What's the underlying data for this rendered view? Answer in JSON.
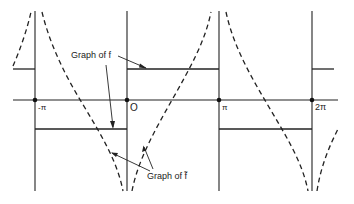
{
  "diagram": {
    "type": "function-graph",
    "colors": {
      "ink": "#222222",
      "background": "#ffffff"
    },
    "axis": {
      "ticks": [
        {
          "label": "-π",
          "value": "-pi"
        },
        {
          "label": "O",
          "value": "0"
        },
        {
          "label": "π",
          "value": "pi"
        },
        {
          "label": "2π",
          "value": "2pi"
        }
      ]
    },
    "labels": {
      "graph_f": "Graph of f",
      "graph_f_tilde": "Graph of f̃"
    },
    "legend": {
      "solid_line": "Graph of f (square wave, step function)",
      "dashed_line": "Graph of f̃ (conjugate function, logarithmic singularities)"
    }
  }
}
